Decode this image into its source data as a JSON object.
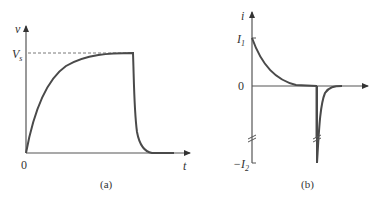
{
  "figure_a": {
    "caption": "(a)",
    "y_axis_label": "v",
    "x_axis_label": "t",
    "level_label": "V",
    "level_subscript": "s",
    "origin_label": "0",
    "curve": "exponential rise to Vs, then rapid exponential decay to 0"
  },
  "figure_b": {
    "caption": "(b)",
    "y_axis_label": "i",
    "upper_label": "I",
    "upper_subscript": "1",
    "zero_label": "0",
    "lower_label": "−I",
    "lower_subscript": "2",
    "curve": "exponential decay from I1 to 0, then sharp negative spike to -I2 decaying back to 0"
  },
  "colors": {
    "curve": "#4a4a4a",
    "axis": "#555555",
    "text": "#333333"
  }
}
